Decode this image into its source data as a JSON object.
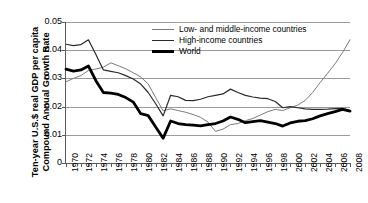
{
  "chart_data": {
    "type": "line",
    "title": "",
    "xlabel": "",
    "ylabel_line1": "Ten-year U.S.$ real GDP per capita",
    "ylabel_line2": "Compound Annual Growth Rate",
    "ylim": [
      0,
      0.05
    ],
    "xlim": [
      1970,
      2008
    ],
    "grid": true,
    "legend_position": "top-center",
    "ytick_labels": [
      "0.05",
      "0.04",
      "0.03",
      "0.02",
      "0.01",
      "0"
    ],
    "ytick_values": [
      0.05,
      0.04,
      0.03,
      0.02,
      0.01,
      0
    ],
    "x": [
      1970,
      1971,
      1972,
      1973,
      1974,
      1975,
      1976,
      1977,
      1978,
      1979,
      1980,
      1981,
      1982,
      1983,
      1984,
      1985,
      1986,
      1987,
      1988,
      1989,
      1990,
      1991,
      1992,
      1993,
      1994,
      1995,
      1996,
      1997,
      1998,
      1999,
      2000,
      2001,
      2002,
      2003,
      2004,
      2005,
      2006,
      2007,
      2008
    ],
    "xtick_labels": [
      "1970",
      "1972",
      "1974",
      "1976",
      "1978",
      "1980",
      "1982",
      "1984",
      "1986",
      "1988",
      "1990",
      "1992",
      "1994",
      "1996",
      "1998",
      "2000",
      "2002",
      "2004",
      "2006",
      "2008"
    ],
    "xtick_values": [
      1970,
      1972,
      1974,
      1976,
      1978,
      1980,
      1982,
      1984,
      1986,
      1988,
      1990,
      1992,
      1994,
      1996,
      1998,
      2000,
      2002,
      2004,
      2006,
      2008
    ],
    "series": [
      {
        "name": "Low- and middle-income countries",
        "color": "#7b7b7b",
        "width": 1.0,
        "values": [
          0.0288,
          0.03,
          0.031,
          0.0328,
          0.0333,
          0.034,
          0.0355,
          0.0345,
          0.0334,
          0.032,
          0.0305,
          0.028,
          0.0232,
          0.0185,
          0.0192,
          0.0186,
          0.018,
          0.0172,
          0.0162,
          0.0145,
          0.0112,
          0.012,
          0.0136,
          0.014,
          0.015,
          0.0158,
          0.017,
          0.0182,
          0.019,
          0.0186,
          0.0196,
          0.0205,
          0.0222,
          0.025,
          0.0285,
          0.0318,
          0.0352,
          0.0392,
          0.0437
        ]
      },
      {
        "name": "High-income countries",
        "color": "#2b2b2b",
        "width": 1.2,
        "values": [
          0.0421,
          0.0416,
          0.042,
          0.0437,
          0.0385,
          0.033,
          0.0325,
          0.032,
          0.031,
          0.0298,
          0.028,
          0.025,
          0.021,
          0.0167,
          0.024,
          0.0235,
          0.0222,
          0.0221,
          0.0226,
          0.0235,
          0.024,
          0.0245,
          0.0262,
          0.025,
          0.024,
          0.0234,
          0.023,
          0.0228,
          0.0218,
          0.0196,
          0.02,
          0.0196,
          0.0192,
          0.019,
          0.019,
          0.0191,
          0.0193,
          0.0194,
          0.0186
        ]
      },
      {
        "name": "World",
        "color": "#000000",
        "width": 2.8,
        "values": [
          0.0333,
          0.0326,
          0.033,
          0.0344,
          0.0292,
          0.025,
          0.0248,
          0.0243,
          0.0232,
          0.0216,
          0.0175,
          0.0168,
          0.0128,
          0.0088,
          0.0149,
          0.014,
          0.0136,
          0.0134,
          0.0132,
          0.0136,
          0.014,
          0.0149,
          0.0163,
          0.0155,
          0.0143,
          0.0147,
          0.015,
          0.0145,
          0.014,
          0.0131,
          0.0142,
          0.0148,
          0.015,
          0.0157,
          0.0167,
          0.0175,
          0.0182,
          0.019,
          0.0184
        ]
      }
    ]
  },
  "legend": {
    "items": [
      {
        "label": "Low- and middle-income countries"
      },
      {
        "label": "High-income countries"
      },
      {
        "label": "World"
      }
    ]
  }
}
